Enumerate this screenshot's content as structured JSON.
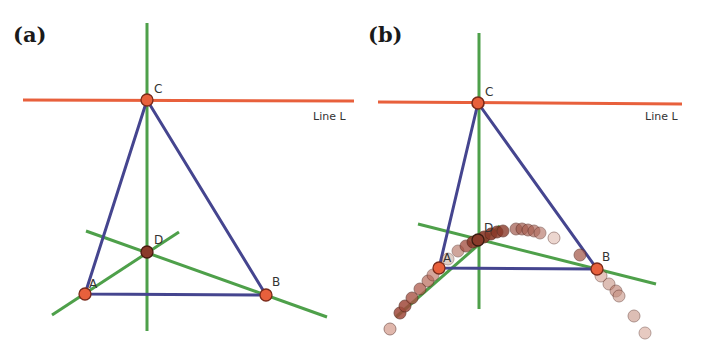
{
  "colors": {
    "line_l": "#e8603c",
    "altitude": "#4ea04a",
    "triangle": "#45458f",
    "vertex_fill": "#e8603c",
    "vertex_stroke": "#7a2a1a",
    "orthocenter_fill": "#8a3a2a",
    "trace_fill": "#9a4a40"
  },
  "panels": [
    {
      "id": "a",
      "label": "(a)",
      "line_label": "Line L",
      "points": {
        "A": {
          "label": "A",
          "x": 85,
          "y": 294
        },
        "B": {
          "label": "B",
          "x": 266,
          "y": 295
        },
        "C": {
          "label": "C",
          "x": 147,
          "y": 100
        },
        "D": {
          "label": "D",
          "x": 147,
          "y": 252
        }
      }
    },
    {
      "id": "b",
      "label": "(b)",
      "line_label": "Line L",
      "points": {
        "A": {
          "label": "A",
          "x": 439,
          "y": 268
        },
        "B": {
          "label": "B",
          "x": 597,
          "y": 269
        },
        "C": {
          "label": "C",
          "x": 478,
          "y": 103
        },
        "D": {
          "label": "D",
          "x": 478,
          "y": 240
        }
      },
      "trace_note": "locus of orthocenter D as C moves along Line L"
    }
  ]
}
